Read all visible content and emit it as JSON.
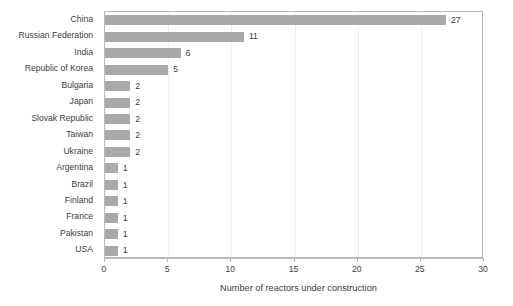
{
  "chart_data": {
    "type": "bar",
    "orientation": "horizontal",
    "title": "",
    "subtitle": "",
    "xlabel": "Number of reactors under construction",
    "ylabel": "",
    "categories": [
      "China",
      "Russian Federation",
      "India",
      "Republic of Korea",
      "Bulgaria",
      "Japan",
      "Slovak Republic",
      "Taiwan",
      "Ukraine",
      "Argentina",
      "Brazil",
      "Finland",
      "France",
      "Pakistan",
      "USA"
    ],
    "values": [
      27,
      11,
      6,
      5,
      2,
      2,
      2,
      2,
      2,
      1,
      1,
      1,
      1,
      1,
      1
    ],
    "data_labels": [
      "27",
      "11",
      "6",
      "5",
      "2",
      "2",
      "2",
      "2",
      "2",
      "1",
      "1",
      "1",
      "1",
      "1",
      "1"
    ],
    "xlim": [
      0,
      30
    ],
    "xticks": [
      0,
      5,
      10,
      15,
      20,
      25,
      30
    ],
    "xtick_labels": [
      "0",
      "5",
      "10",
      "15",
      "20",
      "25",
      "30"
    ],
    "grid": "vertical-major",
    "legend": "none",
    "colors": {
      "bar": "#a9a9a9",
      "text": "#3c3c3c",
      "axis": "#b9b9b9",
      "grid": "#eeeeee",
      "background": "#ffffff"
    }
  }
}
